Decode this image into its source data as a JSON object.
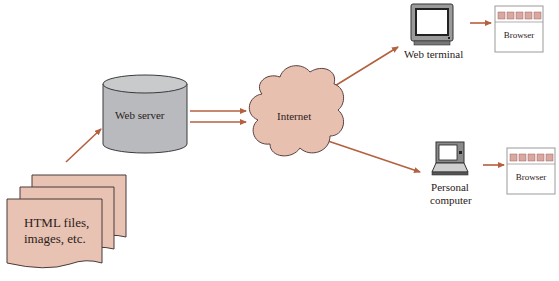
{
  "diagram": {
    "nodes": {
      "html_files": {
        "label_line1": "HTML files,",
        "label_line2": "images, etc."
      },
      "web_server": {
        "label": "Web server"
      },
      "internet": {
        "label": "Internet"
      },
      "web_terminal": {
        "label": "Web terminal"
      },
      "personal_computer": {
        "label_line1": "Personal",
        "label_line2": "computer"
      },
      "browser_top": {
        "label": "Browser"
      },
      "browser_bottom": {
        "label": "Browser"
      }
    },
    "edges": [
      {
        "from": "html_files",
        "to": "web_server"
      },
      {
        "from": "web_server",
        "to": "internet"
      },
      {
        "from": "web_server",
        "to": "internet"
      },
      {
        "from": "internet",
        "to": "web_terminal"
      },
      {
        "from": "internet",
        "to": "personal_computer"
      },
      {
        "from": "web_terminal",
        "to": "browser_top"
      },
      {
        "from": "personal_computer",
        "to": "browser_bottom"
      }
    ],
    "colors": {
      "arrow": "#b5603e",
      "document_fill": "#e8c2b2",
      "cloud_fill": "#e8c0b0",
      "server_fill": "#b8babd",
      "outline": "#4a4040",
      "browser_tab": "#d9a8a0"
    }
  }
}
